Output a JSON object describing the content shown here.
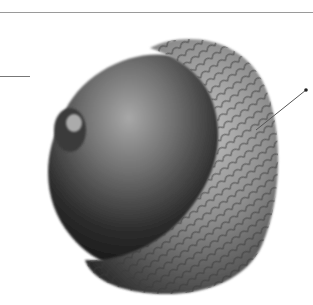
{
  "figure": {
    "style": "grayscale photograph",
    "annotations": [
      {
        "name": "left-leader-line",
        "from": [
          0,
          76
        ],
        "to": [
          30,
          76
        ]
      },
      {
        "name": "right-leader-line",
        "from": [
          256,
          130
        ],
        "to": [
          306,
          90
        ]
      }
    ],
    "colors": {
      "background": "#ffffff",
      "rule": "#9a9a9a",
      "nut_dark": "#1e1e1e",
      "nut_mid": "#555555",
      "nut_light": "#9a9a9a",
      "cap_light": "#b5b5b5",
      "cap_dark": "#4a4a4a"
    }
  }
}
